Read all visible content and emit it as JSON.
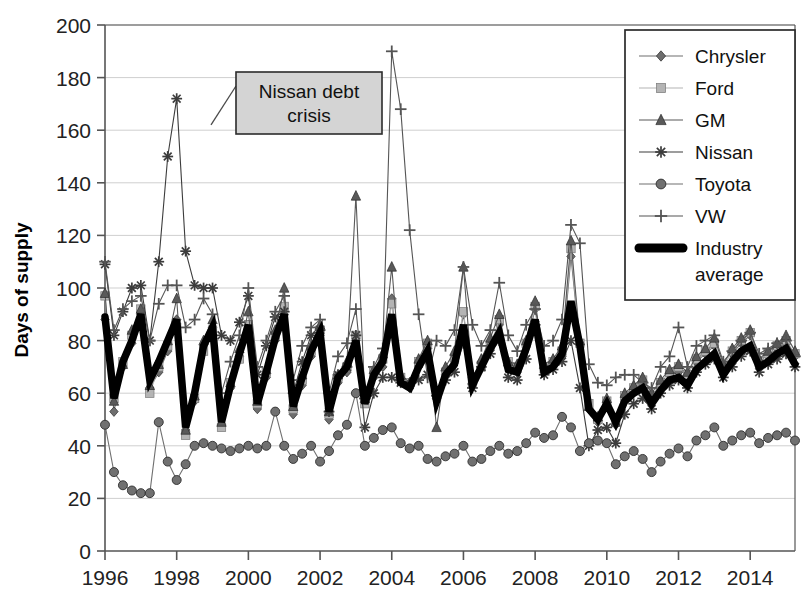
{
  "chart_data": {
    "type": "line",
    "title": "",
    "xlabel": "",
    "ylabel": "Days of supply",
    "ylim": [
      0,
      200
    ],
    "ytick_step": 20,
    "yticks": [
      "0",
      "20",
      "40",
      "60",
      "80",
      "100",
      "120",
      "140",
      "160",
      "180",
      "200"
    ],
    "xlim": [
      1996,
      2015.25
    ],
    "xticks": [
      "1996",
      "1998",
      "2000",
      "2002",
      "2004",
      "2006",
      "2008",
      "2010",
      "2012",
      "2014"
    ],
    "xtick_values": [
      1996,
      1998,
      2000,
      2002,
      2004,
      2006,
      2008,
      2010,
      2012,
      2014
    ],
    "grid": "horizontal",
    "frequency": "quarterly",
    "x": [
      1996,
      1996.25,
      1996.5,
      1996.75,
      1997,
      1997.25,
      1997.5,
      1997.75,
      1998,
      1998.25,
      1998.5,
      1998.75,
      1999,
      1999.25,
      1999.5,
      1999.75,
      2000,
      2000.25,
      2000.5,
      2000.75,
      2001,
      2001.25,
      2001.5,
      2001.75,
      2002,
      2002.25,
      2002.5,
      2002.75,
      2003,
      2003.25,
      2003.5,
      2003.75,
      2004,
      2004.25,
      2004.5,
      2004.75,
      2005,
      2005.25,
      2005.5,
      2005.75,
      2006,
      2006.25,
      2006.5,
      2006.75,
      2007,
      2007.25,
      2007.5,
      2007.75,
      2008,
      2008.25,
      2008.5,
      2008.75,
      2009,
      2009.25,
      2009.5,
      2009.75,
      2010,
      2010.25,
      2010.5,
      2010.75,
      2011,
      2011.25,
      2011.5,
      2011.75,
      2012,
      2012.25,
      2012.5,
      2012.75,
      2013,
      2013.25,
      2013.5,
      2013.75,
      2014,
      2014.25,
      2014.5,
      2014.75,
      2015,
      2015.25
    ],
    "legend_position": "top-right",
    "series": [
      {
        "name": "Chrysler",
        "marker": "diamond",
        "color": "#6e6e6e",
        "values": [
          88,
          53,
          70,
          79,
          90,
          62,
          68,
          76,
          88,
          46,
          57,
          78,
          85,
          48,
          62,
          74,
          86,
          54,
          66,
          80,
          90,
          52,
          63,
          74,
          82,
          50,
          64,
          68,
          80,
          57,
          66,
          70,
          96,
          65,
          62,
          70,
          77,
          58,
          67,
          72,
          90,
          66,
          72,
          79,
          86,
          70,
          68,
          78,
          92,
          68,
          70,
          74,
          112,
          78,
          54,
          49,
          55,
          48,
          57,
          61,
          63,
          57,
          63,
          67,
          68,
          65,
          72,
          75,
          78,
          68,
          75,
          79,
          82,
          70,
          74,
          77,
          79,
          74
        ]
      },
      {
        "name": "Ford",
        "marker": "square",
        "color": "#b4b4b4",
        "values": [
          97,
          58,
          72,
          82,
          92,
          60,
          70,
          78,
          85,
          44,
          58,
          76,
          84,
          47,
          64,
          73,
          86,
          56,
          68,
          82,
          93,
          54,
          65,
          76,
          84,
          52,
          66,
          70,
          82,
          56,
          68,
          73,
          94,
          66,
          64,
          72,
          79,
          60,
          68,
          73,
          91,
          64,
          70,
          78,
          88,
          72,
          70,
          79,
          93,
          70,
          72,
          76,
          115,
          79,
          56,
          50,
          57,
          50,
          59,
          62,
          65,
          59,
          64,
          68,
          70,
          67,
          73,
          76,
          79,
          70,
          76,
          80,
          83,
          72,
          75,
          78,
          80,
          75
        ]
      },
      {
        "name": "GM",
        "marker": "triangle",
        "color": "#595959",
        "values": [
          98,
          57,
          71,
          84,
          92,
          63,
          71,
          80,
          96,
          46,
          59,
          80,
          88,
          49,
          64,
          77,
          91,
          57,
          69,
          84,
          100,
          55,
          67,
          78,
          86,
          53,
          67,
          72,
          135,
          58,
          69,
          75,
          108,
          67,
          64,
          73,
          80,
          47,
          70,
          76,
          108,
          65,
          73,
          81,
          90,
          72,
          71,
          80,
          95,
          71,
          73,
          78,
          118,
          80,
          55,
          51,
          58,
          49,
          60,
          63,
          66,
          60,
          65,
          69,
          71,
          68,
          74,
          77,
          81,
          71,
          77,
          81,
          84,
          73,
          76,
          79,
          82,
          76
        ]
      },
      {
        "name": "Nissan",
        "marker": "star",
        "color": "#3c3c3c",
        "values": [
          109,
          82,
          91,
          100,
          101,
          80,
          110,
          150,
          172,
          114,
          101,
          100,
          100,
          82,
          80,
          87,
          97,
          67,
          78,
          89,
          91,
          60,
          72,
          82,
          84,
          53,
          67,
          70,
          82,
          47,
          60,
          66,
          66,
          64,
          63,
          65,
          67,
          59,
          65,
          68,
          79,
          62,
          70,
          75,
          80,
          66,
          65,
          73,
          86,
          67,
          69,
          72,
          80,
          62,
          40,
          46,
          47,
          41,
          52,
          56,
          58,
          54,
          60,
          63,
          65,
          62,
          68,
          71,
          73,
          66,
          70,
          74,
          76,
          68,
          71,
          73,
          75,
          70
        ]
      },
      {
        "name": "Toyota",
        "marker": "circle",
        "color": "#707070",
        "values": [
          48,
          30,
          25,
          23,
          22,
          22,
          49,
          34,
          27,
          33,
          40,
          41,
          40,
          39,
          38,
          39,
          40,
          39,
          40,
          53,
          40,
          35,
          37,
          40,
          34,
          38,
          44,
          48,
          60,
          40,
          43,
          46,
          47,
          41,
          39,
          40,
          35,
          34,
          36,
          37,
          40,
          34,
          35,
          38,
          40,
          37,
          38,
          41,
          45,
          43,
          44,
          51,
          47,
          38,
          41,
          42,
          41,
          33,
          36,
          38,
          35,
          30,
          34,
          37,
          39,
          36,
          42,
          44,
          47,
          40,
          42,
          44,
          45,
          41,
          43,
          44,
          45,
          42
        ]
      },
      {
        "name": "VW",
        "marker": "plus",
        "color": "#555555",
        "values": [
          110,
          84,
          92,
          95,
          97,
          80,
          94,
          101,
          101,
          85,
          88,
          96,
          90,
          60,
          72,
          82,
          100,
          70,
          80,
          91,
          97,
          65,
          78,
          85,
          88,
          60,
          74,
          79,
          92,
          58,
          70,
          77,
          190,
          168,
          122,
          90,
          66,
          80,
          78,
          84,
          108,
          86,
          78,
          84,
          102,
          82,
          76,
          86,
          92,
          78,
          80,
          88,
          124,
          117,
          71,
          64,
          63,
          66,
          67,
          67,
          64,
          62,
          70,
          74,
          85,
          70,
          78,
          80,
          82,
          72,
          76,
          80,
          83,
          75,
          77,
          79,
          80,
          74
        ]
      },
      {
        "name": "Industry average",
        "marker": "none",
        "color": "#000000",
        "thick": true,
        "values": [
          89,
          58,
          72,
          80,
          90,
          65,
          72,
          80,
          88,
          47,
          60,
          78,
          85,
          49,
          63,
          75,
          86,
          56,
          68,
          81,
          90,
          55,
          66,
          76,
          83,
          53,
          66,
          70,
          80,
          56,
          67,
          72,
          90,
          64,
          62,
          70,
          76,
          57,
          67,
          71,
          86,
          63,
          70,
          77,
          83,
          69,
          68,
          77,
          88,
          68,
          70,
          75,
          95,
          78,
          54,
          50,
          56,
          49,
          57,
          60,
          62,
          56,
          61,
          65,
          66,
          63,
          69,
          72,
          75,
          67,
          72,
          76,
          78,
          70,
          72,
          75,
          77,
          71
        ]
      }
    ],
    "annotations": [
      {
        "text_line1": "Nissan debt",
        "text_line2": "crisis",
        "label": "Nissan debt crisis",
        "points_to_x": 1998.5,
        "points_to_y": 162
      }
    ]
  },
  "legend": {
    "entries": [
      {
        "label": "Chrysler"
      },
      {
        "label": "Ford"
      },
      {
        "label": "GM"
      },
      {
        "label": "Nissan"
      },
      {
        "label": "Toyota"
      },
      {
        "label": "VW"
      },
      {
        "label": "Industry"
      },
      {
        "label": "average"
      }
    ]
  },
  "axis": {
    "y_title": "Days of supply"
  },
  "colors": {
    "chrysler": "#6e6e6e",
    "ford": "#b4b4b4",
    "gm": "#595959",
    "nissan": "#3c3c3c",
    "toyota": "#707070",
    "vw": "#555555",
    "industry": "#000000",
    "grid": "#cfcfcf",
    "axis": "#555555",
    "annotation_fill": "#d4d4d4"
  }
}
